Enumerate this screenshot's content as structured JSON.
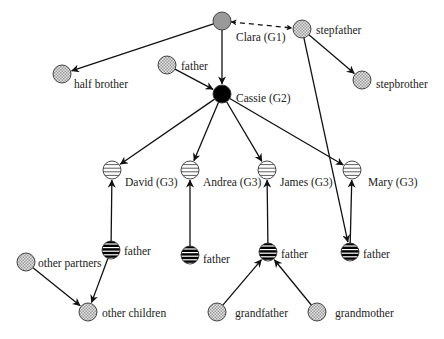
{
  "legend_styles": {
    "G1": "gray-solid",
    "G2": "black-solid",
    "G3": "horizontal-striped-light",
    "father": "horizontal-striped-dark",
    "other": "crosshatch-light"
  },
  "colors": {
    "gray_node": "#9a9a9a",
    "black_node": "#000000",
    "crosshatch": "#bdbdbd",
    "edge": "#111111"
  },
  "nodes": [
    {
      "id": "clara",
      "label": "Clara (G1)",
      "style": "gray"
    },
    {
      "id": "stepfather",
      "label": "stepfather",
      "style": "hatch"
    },
    {
      "id": "half_brother",
      "label": "half brother",
      "style": "hatch"
    },
    {
      "id": "stepbrother",
      "label": "stepbrother",
      "style": "hatch"
    },
    {
      "id": "father_cassie",
      "label": "father",
      "style": "hatch"
    },
    {
      "id": "cassie",
      "label": "Cassie (G2)",
      "style": "black"
    },
    {
      "id": "david",
      "label": "David (G3)",
      "style": "stripe-light"
    },
    {
      "id": "andrea",
      "label": "Andrea (G3)",
      "style": "stripe-light"
    },
    {
      "id": "james",
      "label": "James (G3)",
      "style": "stripe-light"
    },
    {
      "id": "mary",
      "label": "Mary (G3)",
      "style": "stripe-light"
    },
    {
      "id": "father_david",
      "label": "father",
      "style": "stripe-dark"
    },
    {
      "id": "father_andrea",
      "label": "father",
      "style": "stripe-dark"
    },
    {
      "id": "father_james",
      "label": "father",
      "style": "stripe-dark"
    },
    {
      "id": "father_mary",
      "label": "father",
      "style": "stripe-dark"
    },
    {
      "id": "other_partners",
      "label": "other partners",
      "style": "hatch"
    },
    {
      "id": "other_children",
      "label": "other children",
      "style": "hatch"
    },
    {
      "id": "grandfather",
      "label": "grandfather",
      "style": "hatch"
    },
    {
      "id": "grandmother",
      "label": "grandmother",
      "style": "hatch"
    }
  ],
  "edges": [
    {
      "from": "clara",
      "to": "stepfather",
      "type": "dashed-bidirectional"
    },
    {
      "from": "clara",
      "to": "half_brother",
      "type": "arrow"
    },
    {
      "from": "clara",
      "to": "cassie",
      "type": "arrow"
    },
    {
      "from": "stepfather",
      "to": "stepbrother",
      "type": "arrow"
    },
    {
      "from": "stepfather",
      "to": "father_mary",
      "type": "arrow"
    },
    {
      "from": "father_cassie",
      "to": "cassie",
      "type": "arrow"
    },
    {
      "from": "cassie",
      "to": "david",
      "type": "arrow"
    },
    {
      "from": "cassie",
      "to": "andrea",
      "type": "arrow"
    },
    {
      "from": "cassie",
      "to": "james",
      "type": "arrow"
    },
    {
      "from": "cassie",
      "to": "mary",
      "type": "arrow"
    },
    {
      "from": "father_david",
      "to": "david",
      "type": "arrow"
    },
    {
      "from": "father_andrea",
      "to": "andrea",
      "type": "arrow"
    },
    {
      "from": "father_james",
      "to": "james",
      "type": "arrow"
    },
    {
      "from": "father_mary",
      "to": "mary",
      "type": "arrow"
    },
    {
      "from": "father_david",
      "to": "other_children",
      "type": "arrow"
    },
    {
      "from": "other_partners",
      "to": "other_children",
      "type": "arrow"
    },
    {
      "from": "grandfather",
      "to": "father_james",
      "type": "arrow"
    },
    {
      "from": "grandmother",
      "to": "father_james",
      "type": "arrow"
    }
  ]
}
